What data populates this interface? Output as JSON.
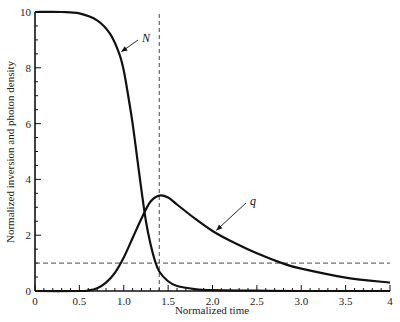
{
  "chart_data": {
    "type": "line",
    "title": "",
    "xlabel": "Normalized time",
    "ylabel": "Normalized inversion and photon density",
    "xlim": [
      0,
      4
    ],
    "ylim": [
      0,
      10
    ],
    "x_ticks": [
      "0",
      "0.5",
      "1.0",
      "1.5",
      "2.0",
      "2.5",
      "3.0",
      "3.5",
      "4"
    ],
    "y_ticks": [
      "0",
      "2",
      "4",
      "6",
      "8",
      "10"
    ],
    "grid": false,
    "series": [
      {
        "name": "N",
        "x": [
          0,
          0.3,
          0.5,
          0.7,
          0.85,
          0.95,
          1.0,
          1.05,
          1.1,
          1.15,
          1.2,
          1.25,
          1.3,
          1.35,
          1.4,
          1.5,
          1.6,
          1.8,
          2.0,
          2.5,
          3.0,
          4.0
        ],
        "values": [
          10,
          10,
          9.95,
          9.7,
          9.2,
          8.5,
          7.9,
          7.0,
          6.0,
          4.8,
          3.6,
          2.5,
          1.7,
          1.1,
          0.7,
          0.35,
          0.18,
          0.07,
          0.03,
          0.01,
          0.0,
          0.0
        ]
      },
      {
        "name": "q",
        "x": [
          0,
          0.5,
          0.6,
          0.7,
          0.8,
          0.9,
          1.0,
          1.1,
          1.2,
          1.3,
          1.4,
          1.5,
          1.6,
          1.8,
          2.0,
          2.2,
          2.5,
          2.8,
          3.0,
          3.5,
          4.0
        ],
        "values": [
          0,
          0,
          0.02,
          0.1,
          0.3,
          0.65,
          1.2,
          1.9,
          2.6,
          3.2,
          3.42,
          3.35,
          3.1,
          2.6,
          2.15,
          1.8,
          1.35,
          0.98,
          0.8,
          0.48,
          0.3
        ]
      }
    ],
    "reference_lines": [
      {
        "type": "vertical",
        "x": 1.4,
        "style": "dashed"
      },
      {
        "type": "horizontal",
        "y": 1.0,
        "style": "dashed"
      }
    ],
    "annotations": [
      {
        "text": "N",
        "points_to": {
          "x": 0.95,
          "y": 8.5
        }
      },
      {
        "text": "q",
        "points_to": {
          "x": 2.02,
          "y": 2.1
        }
      }
    ]
  }
}
